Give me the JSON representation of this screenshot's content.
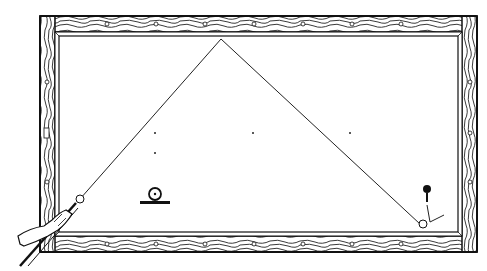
{
  "diagram": {
    "title": "",
    "type": "billiard-table-shot-diagram",
    "colors": {
      "ink": "#1a1a1a",
      "background": "#ffffff",
      "wood_grain": "#333333"
    },
    "table": {
      "outer": {
        "x": 40,
        "y": 16,
        "w": 437,
        "h": 236
      },
      "rail_width": 14,
      "cushion_inner": {
        "x": 56,
        "y": 34,
        "w": 401,
        "h": 200
      },
      "diamonds_top": [
        107,
        156,
        205,
        254,
        303,
        352,
        401
      ],
      "diamonds_bottom": [
        107,
        156,
        205,
        254,
        303,
        352,
        401
      ],
      "diamonds_left": [
        82,
        182
      ],
      "diamonds_right": [
        82,
        133,
        182
      ],
      "left_rail_marker": {
        "x": 45,
        "y": 133
      }
    },
    "spots": [
      {
        "x": 155,
        "y": 133
      },
      {
        "x": 253,
        "y": 133
      },
      {
        "x": 350,
        "y": 133
      },
      {
        "x": 155,
        "y": 153
      }
    ],
    "cue_ball": {
      "x": 80,
      "y": 199,
      "r": 4
    },
    "shot_path": [
      [
        80,
        199
      ],
      [
        221,
        39
      ],
      [
        420,
        224
      ]
    ],
    "object_ball_marker": {
      "label": "ball-on-spot-icon",
      "x": 155,
      "y": 194
    },
    "target_ball": {
      "x": 427,
      "y": 189
    },
    "target_ball_end": {
      "x": 423,
      "y": 226
    },
    "cue_stick": {
      "from": [
        20,
        266
      ],
      "to": [
        78,
        202
      ]
    }
  }
}
